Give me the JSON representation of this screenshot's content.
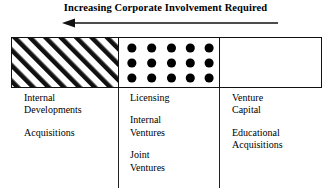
{
  "figure": {
    "title": "Increasing Corporate Involvement Required",
    "arrow": {
      "name": "left-arrow",
      "direction": "left",
      "color": "#111111"
    },
    "band": {
      "cells": [
        {
          "id": "internal-development-cell",
          "fill": "diagonal-hatch"
        },
        {
          "id": "venturing-cell",
          "fill": "dot-grid",
          "dot_columns": 5,
          "dot_rows": 3,
          "dot_color": "#000000"
        },
        {
          "id": "external-cell",
          "fill": "blank"
        }
      ]
    },
    "columns": [
      {
        "id": "column-internal",
        "groups": [
          {
            "lines": [
              "Internal",
              "Developments"
            ]
          },
          {
            "lines": [
              "Acquisitions"
            ]
          }
        ]
      },
      {
        "id": "column-venturing",
        "groups": [
          {
            "lines": [
              "Licensing"
            ]
          },
          {
            "lines": [
              "Internal",
              "Ventures"
            ]
          },
          {
            "lines": [
              "Joint",
              "Ventures"
            ]
          }
        ]
      },
      {
        "id": "column-external",
        "groups": [
          {
            "lines": [
              "Venture",
              "Capital"
            ]
          },
          {
            "lines": [
              "Educational",
              "Acquisitions"
            ]
          }
        ]
      }
    ]
  }
}
